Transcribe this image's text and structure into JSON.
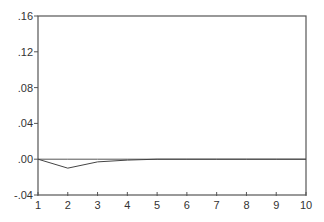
{
  "chart_data": {
    "type": "line",
    "title": "",
    "xlabel": "",
    "ylabel": "",
    "x": [
      1,
      2,
      3,
      4,
      5,
      6,
      7,
      8,
      9,
      10
    ],
    "series": [
      {
        "name": "response",
        "values": [
          0.0,
          -0.01,
          -0.003,
          -0.001,
          0.0,
          0.0,
          0.0,
          0.0,
          0.0,
          0.0
        ]
      },
      {
        "name": "zero-line",
        "values": [
          0,
          0,
          0,
          0,
          0,
          0,
          0,
          0,
          0,
          0
        ]
      }
    ],
    "xlim": [
      1,
      10
    ],
    "ylim": [
      -0.04,
      0.16
    ],
    "y_ticks": [
      {
        "value": 0.16,
        "label": ".16"
      },
      {
        "value": 0.12,
        "label": ".12"
      },
      {
        "value": 0.08,
        "label": ".08"
      },
      {
        "value": 0.04,
        "label": ".04"
      },
      {
        "value": 0.0,
        "label": ".00"
      },
      {
        "value": -0.04,
        "label": "-.04"
      }
    ],
    "x_ticks": [
      {
        "value": 1,
        "label": "1"
      },
      {
        "value": 2,
        "label": "2"
      },
      {
        "value": 3,
        "label": "3"
      },
      {
        "value": 4,
        "label": "4"
      },
      {
        "value": 5,
        "label": "5"
      },
      {
        "value": 6,
        "label": "6"
      },
      {
        "value": 7,
        "label": "7"
      },
      {
        "value": 8,
        "label": "8"
      },
      {
        "value": 9,
        "label": "9"
      },
      {
        "value": 10,
        "label": "10"
      }
    ],
    "grid": false,
    "legend": "none",
    "colors": {
      "axis": "#555555",
      "line": "#444444",
      "zero": "#555555"
    }
  }
}
